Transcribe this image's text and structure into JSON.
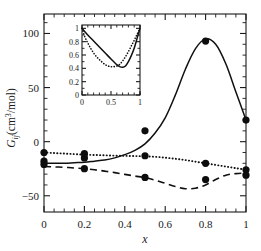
{
  "figure": {
    "title": "",
    "background": "#ffffff"
  },
  "axes": {
    "xlabel": "x",
    "ylabel": "G",
    "ylabel_sub": "ij",
    "ylabel_unit": "(cm",
    "ylabel_sup": "3",
    "ylabel_unit_tail": "/mol)",
    "x_ticks": [
      "0",
      "0.2",
      "0.4",
      "0.6",
      "0.8",
      "1"
    ],
    "y_ticks": [
      "100",
      "50",
      "0",
      "-50"
    ]
  },
  "inset": {
    "x_ticks": [
      "0",
      "0.5",
      "1"
    ],
    "y_ticks": [
      "0",
      "0.2",
      "0.4",
      "0.6",
      "0.8",
      "1"
    ]
  },
  "chart_data": {
    "type": "line",
    "title": "",
    "xlabel": "x",
    "ylabel": "G_ij (cm^3/mol)",
    "xlim": [
      0,
      1
    ],
    "ylim": [
      -65,
      118
    ],
    "grid": false,
    "legend": null,
    "x_ticks": [
      0,
      0.2,
      0.4,
      0.6,
      0.8,
      1
    ],
    "y_ticks": [
      100,
      50,
      0,
      -50
    ],
    "series": [
      {
        "name": "solid-curve",
        "style": "solid",
        "x": [
          0,
          0.05,
          0.1,
          0.15,
          0.2,
          0.25,
          0.3,
          0.35,
          0.4,
          0.45,
          0.5,
          0.55,
          0.6,
          0.65,
          0.7,
          0.75,
          0.8,
          0.85,
          0.9,
          0.95,
          1
        ],
        "y": [
          -20,
          -20,
          -20,
          -19.5,
          -19,
          -18,
          -17,
          -15,
          -12,
          -8,
          -2,
          8,
          22,
          43,
          67,
          86,
          95,
          90,
          72,
          46,
          20
        ]
      },
      {
        "name": "dotted-curve",
        "style": "dotted",
        "x": [
          0,
          0.05,
          0.1,
          0.15,
          0.2,
          0.25,
          0.3,
          0.35,
          0.4,
          0.45,
          0.5,
          0.55,
          0.6,
          0.65,
          0.7,
          0.75,
          0.8,
          0.85,
          0.9,
          0.95,
          1
        ],
        "y": [
          -10,
          -10.5,
          -11,
          -11.5,
          -12,
          -12.3,
          -12.6,
          -12.9,
          -13.1,
          -13.3,
          -13.5,
          -14,
          -14.8,
          -15.8,
          -17,
          -18.5,
          -20,
          -21.5,
          -23,
          -24.5,
          -26
        ]
      },
      {
        "name": "dashed-curve",
        "style": "dashed",
        "x": [
          0,
          0.05,
          0.1,
          0.15,
          0.2,
          0.25,
          0.3,
          0.35,
          0.4,
          0.45,
          0.5,
          0.55,
          0.6,
          0.65,
          0.7,
          0.75,
          0.8,
          0.85,
          0.9,
          0.95,
          1
        ],
        "y": [
          -23,
          -23.3,
          -23.7,
          -24.3,
          -25,
          -26,
          -27.2,
          -28.6,
          -30.2,
          -31.8,
          -33.3,
          -35.5,
          -38.5,
          -41.5,
          -43.5,
          -43,
          -40,
          -35,
          -31,
          -29.5,
          -29
        ]
      }
    ],
    "points": [
      {
        "x": 0,
        "y": -10
      },
      {
        "x": 0,
        "y": -18
      },
      {
        "x": 0,
        "y": -21
      },
      {
        "x": 0.2,
        "y": -11
      },
      {
        "x": 0.2,
        "y": -15
      },
      {
        "x": 0.2,
        "y": -25
      },
      {
        "x": 0.5,
        "y": 10
      },
      {
        "x": 0.5,
        "y": -13
      },
      {
        "x": 0.5,
        "y": -33
      },
      {
        "x": 0.8,
        "y": 93
      },
      {
        "x": 0.8,
        "y": -20
      },
      {
        "x": 0.8,
        "y": -35
      },
      {
        "x": 1,
        "y": 20
      },
      {
        "x": 1,
        "y": -26
      },
      {
        "x": 1,
        "y": -31
      }
    ],
    "inset": {
      "type": "line",
      "xlim": [
        0,
        1
      ],
      "ylim": [
        0,
        1.05
      ],
      "x_ticks": [
        0,
        0.5,
        1
      ],
      "y_ticks": [
        0,
        0.2,
        0.4,
        0.6,
        0.8,
        1
      ],
      "grid": false,
      "series": [
        {
          "name": "inset-solid-curve",
          "style": "solid",
          "x": [
            0,
            0.05,
            0.1,
            0.2,
            0.3,
            0.4,
            0.5,
            0.6,
            0.65,
            0.7,
            0.75,
            0.8,
            0.85,
            0.9,
            0.95,
            1
          ],
          "y": [
            1.0,
            0.95,
            0.9,
            0.81,
            0.72,
            0.63,
            0.54,
            0.455,
            0.425,
            0.415,
            0.435,
            0.5,
            0.59,
            0.7,
            0.85,
            1.0
          ]
        },
        {
          "name": "inset-dotted-curve",
          "style": "dotted",
          "x": [
            0,
            0.05,
            0.1,
            0.15,
            0.2,
            0.25,
            0.3,
            0.35,
            0.4,
            0.45,
            0.5,
            0.55,
            0.6,
            0.65,
            0.7,
            0.75,
            0.8,
            0.85,
            0.9,
            0.95,
            1
          ],
          "y": [
            1.0,
            0.87,
            0.78,
            0.7,
            0.63,
            0.575,
            0.53,
            0.49,
            0.455,
            0.435,
            0.425,
            0.425,
            0.435,
            0.46,
            0.51,
            0.575,
            0.65,
            0.735,
            0.82,
            0.91,
            1.0
          ]
        }
      ]
    }
  }
}
